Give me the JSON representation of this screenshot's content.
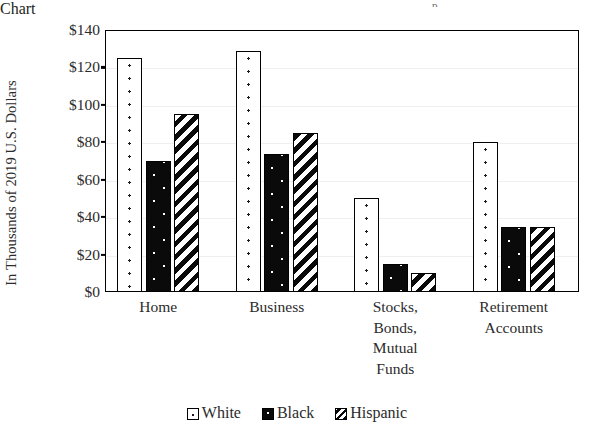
{
  "chart_data": {
    "type": "bar",
    "title": "",
    "xlabel": "",
    "ylabel": "In Thousands of 2019 U.S. Dollars",
    "ylim": [
      0,
      140
    ],
    "ytick_step": 20,
    "ytick_labels": [
      "$140",
      "$120",
      "$100",
      "$80",
      "$60",
      "$40",
      "$20",
      "$0"
    ],
    "ytick_values": [
      140,
      120,
      100,
      80,
      60,
      40,
      20,
      0
    ],
    "grid": true,
    "legend_position": "bottom",
    "categories": [
      "Home",
      "Business",
      "Stocks,\nBonds,\nMutual\nFunds",
      "Retirement\nAccounts"
    ],
    "category_lines": [
      [
        "Home"
      ],
      [
        "Business"
      ],
      [
        "Stocks,",
        "Bonds,",
        "Mutual",
        "Funds"
      ],
      [
        "Retirement",
        "Accounts"
      ]
    ],
    "series": [
      {
        "name": "White",
        "pattern": "white-dotted",
        "values": [
          125,
          129,
          50,
          80
        ]
      },
      {
        "name": "Black",
        "pattern": "black-dotted",
        "values": [
          70,
          74,
          15,
          35
        ]
      },
      {
        "name": "Hispanic",
        "pattern": "diagonal-hatch",
        "values": [
          95,
          85,
          10,
          35
        ]
      }
    ],
    "colors": {
      "axis": "#000000",
      "text": "#2b2b2b",
      "gridline": "#efefef",
      "series_white_fill": "#ffffff",
      "series_black_fill": "#0a0a0a",
      "series_hispanic_fill": "#ffffff",
      "pattern_ink": "#0a0a0a"
    }
  },
  "legend": {
    "items": [
      {
        "label": "White",
        "swatch": "white-dotted-swatch"
      },
      {
        "label": "Black",
        "swatch": "black-dotted-swatch"
      },
      {
        "label": "Hispanic",
        "swatch": "diagonal-hatch-swatch"
      }
    ]
  },
  "artifact": {
    "top_clipped_text": "p"
  }
}
